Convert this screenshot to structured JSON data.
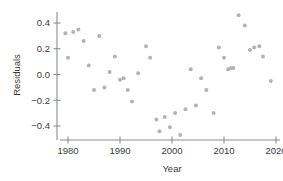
{
  "chart_data": {
    "type": "scatter",
    "title": "",
    "xlabel": "Year",
    "ylabel": "Residuals",
    "xlim": [
      1977,
      2021.5
    ],
    "ylim": [
      -0.52,
      0.5
    ],
    "grid": false,
    "legend": null,
    "marker_color": "#b3b3b3",
    "axis_color": "#8c8c8c",
    "text_color": "#3a3a3a",
    "xticks": [
      1980,
      1990,
      2000,
      2010,
      2020
    ],
    "xtick_labels": [
      "1980",
      "1990",
      "2000",
      "2010",
      "2020"
    ],
    "yticks": [
      -0.4,
      -0.2,
      0.0,
      0.2,
      0.4
    ],
    "ytick_labels": [
      "-0.4",
      "-0.2",
      "0.0",
      "0.2",
      "0.4"
    ],
    "series": [
      {
        "name": "residuals",
        "points": [
          [
            1979.5,
            0.32
          ],
          [
            1980.0,
            0.13
          ],
          [
            1981.0,
            0.33
          ],
          [
            1982.0,
            0.35
          ],
          [
            1983.0,
            0.26
          ],
          [
            1984.0,
            0.07
          ],
          [
            1985.0,
            -0.12
          ],
          [
            1986.0,
            0.3
          ],
          [
            1987.0,
            -0.1
          ],
          [
            1988.0,
            0.02
          ],
          [
            1989.0,
            0.14
          ],
          [
            1990.0,
            -0.04
          ],
          [
            1990.7,
            -0.03
          ],
          [
            1991.5,
            -0.12
          ],
          [
            1992.3,
            -0.21
          ],
          [
            1993.5,
            0.01
          ],
          [
            1995.0,
            0.22
          ],
          [
            1995.8,
            0.13
          ],
          [
            1997.0,
            -0.35
          ],
          [
            1997.6,
            -0.44
          ],
          [
            1998.6,
            -0.33
          ],
          [
            1999.6,
            -0.41
          ],
          [
            2000.6,
            -0.3
          ],
          [
            2001.6,
            -0.47
          ],
          [
            2002.6,
            -0.27
          ],
          [
            2003.6,
            0.04
          ],
          [
            2004.6,
            -0.24
          ],
          [
            2005.6,
            -0.03
          ],
          [
            2006.6,
            -0.12
          ],
          [
            2008.0,
            -0.3
          ],
          [
            2009.0,
            0.21
          ],
          [
            2010.0,
            0.13
          ],
          [
            2010.8,
            0.04
          ],
          [
            2011.3,
            0.05
          ],
          [
            2011.8,
            0.05
          ],
          [
            2012.8,
            0.46
          ],
          [
            2014.0,
            0.38
          ],
          [
            2015.0,
            0.19
          ],
          [
            2015.8,
            0.21
          ],
          [
            2016.8,
            0.22
          ],
          [
            2017.5,
            0.14
          ],
          [
            2019.0,
            -0.05
          ]
        ]
      }
    ]
  }
}
